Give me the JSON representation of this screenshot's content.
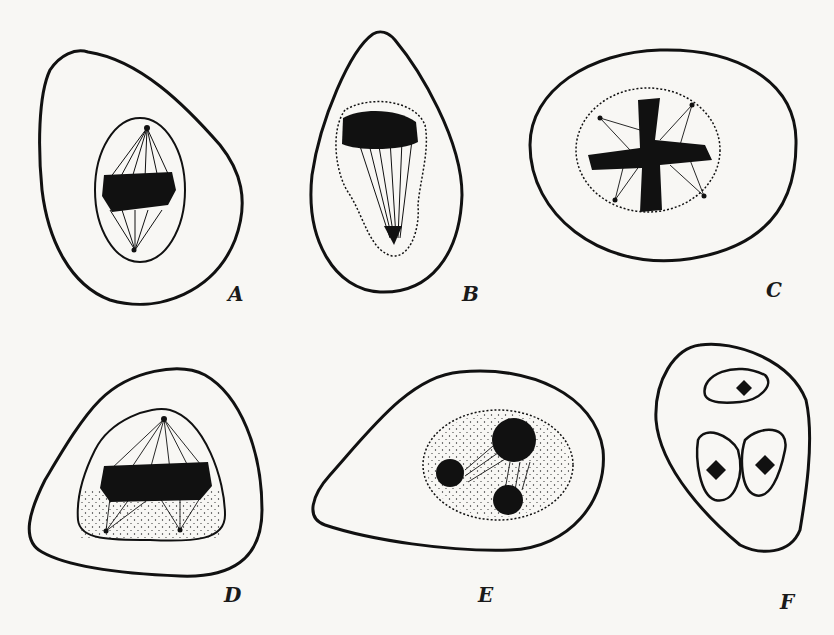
{
  "figure": {
    "panels": [
      {
        "id": "A",
        "label": "A",
        "stage": "metaphone spindle, side view"
      },
      {
        "id": "B",
        "label": "B",
        "stage": "anaphase-like, chromosomes at one pole"
      },
      {
        "id": "C",
        "label": "C",
        "stage": "multipolar spindle, four poles"
      },
      {
        "id": "D",
        "label": "D",
        "stage": "tripolar spindle"
      },
      {
        "id": "E",
        "label": "E",
        "stage": "three daughter nuclei reforming"
      },
      {
        "id": "F",
        "label": "F",
        "stage": "cell with three nuclei"
      }
    ],
    "colors": {
      "ink": "#111111",
      "paper": "#f8f7f4"
    }
  }
}
